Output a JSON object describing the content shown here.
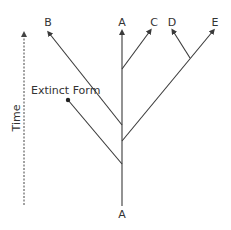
{
  "diagram": {
    "type": "phylogenetic-tree",
    "axis": {
      "label": "Time",
      "direction": "up"
    },
    "root_label": "A",
    "tips": [
      {
        "id": "B",
        "label": "B"
      },
      {
        "id": "A",
        "label": "A"
      },
      {
        "id": "C",
        "label": "C"
      },
      {
        "id": "D",
        "label": "D"
      },
      {
        "id": "E",
        "label": "E"
      }
    ],
    "extinct": {
      "label": "Extinct Form"
    },
    "colors": {
      "line": "#3a3a3a",
      "text": "#333333"
    }
  }
}
